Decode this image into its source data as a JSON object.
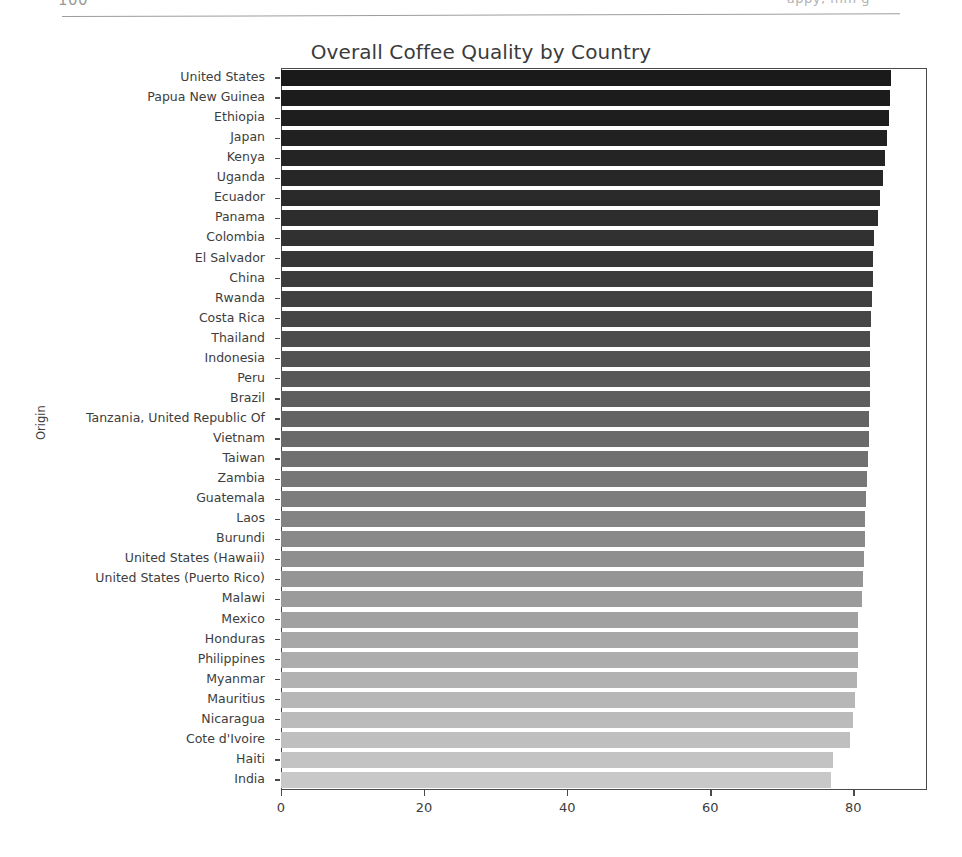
{
  "page_header": {
    "left_text": "100",
    "right_text": "appy, mm g",
    "rule": "horizontal-rule"
  },
  "figure": {
    "title": "Overall Coffee Quality by Country",
    "y_axis_label": "Origin"
  },
  "chart_data": {
    "type": "bar",
    "orientation": "horizontal",
    "title": "Overall Coffee Quality by Country",
    "xlabel": "",
    "ylabel": "Origin",
    "xlim": [
      0,
      90.3
    ],
    "xticks": [
      0,
      20,
      40,
      60,
      80
    ],
    "xtick_labels": [
      "0",
      "20",
      "40",
      "60",
      "80"
    ],
    "grid": false,
    "legend": "none",
    "colormap": "greys-sequential-dark-to-light",
    "categories": [
      "United States",
      "Papua New Guinea",
      "Ethiopia",
      "Japan",
      "Kenya",
      "Uganda",
      "Ecuador",
      "Panama",
      "Colombia",
      "El Salvador",
      "China",
      "Rwanda",
      "Costa Rica",
      "Thailand",
      "Indonesia",
      "Peru",
      "Brazil",
      "Tanzania, United Republic Of",
      "Vietnam",
      "Taiwan",
      "Zambia",
      "Guatemala",
      "Laos",
      "Burundi",
      "United States (Hawaii)",
      "United States (Puerto Rico)",
      "Malawi",
      "Mexico",
      "Honduras",
      "Philippines",
      "Myanmar",
      "Mauritius",
      "Nicaragua",
      "Cote d'Ivoire",
      "Haiti",
      "India"
    ],
    "values": [
      85.3,
      85.1,
      85.0,
      84.7,
      84.4,
      84.1,
      83.8,
      83.5,
      82.9,
      82.8,
      82.7,
      82.6,
      82.5,
      82.4,
      82.4,
      82.3,
      82.3,
      82.2,
      82.2,
      82.1,
      81.9,
      81.8,
      81.7,
      81.6,
      81.5,
      81.4,
      81.2,
      80.7,
      80.6,
      80.6,
      80.5,
      80.2,
      80.0,
      79.6,
      77.1,
      76.9
    ],
    "bar_colors": [
      "#1a1a1a",
      "#1c1c1c",
      "#1e1e1e",
      "#212121",
      "#242424",
      "#272727",
      "#2a2a2a",
      "#2d2d2d",
      "#313131",
      "#363636",
      "#3b3b3b",
      "#404040",
      "#464646",
      "#4c4c4c",
      "#525252",
      "#585858",
      "#5e5e5e",
      "#646464",
      "#6a6a6a",
      "#707070",
      "#777777",
      "#7d7d7d",
      "#838383",
      "#898989",
      "#8f8f8f",
      "#959595",
      "#9b9b9b",
      "#a1a1a1",
      "#a7a7a7",
      "#adadad",
      "#b2b2b2",
      "#b7b7b7",
      "#bbbbbb",
      "#bfbfbf",
      "#c3c3c3",
      "#c8c8c8"
    ]
  }
}
